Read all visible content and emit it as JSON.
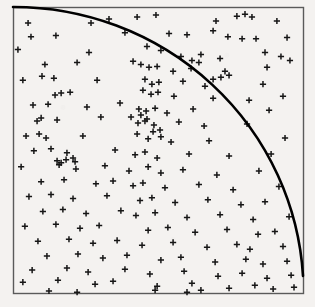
{
  "figure": {
    "kind": "scatter-with-quarter-circle-overlay",
    "background_color": "#f4f2f0",
    "frame": {
      "left": 13,
      "top": 7,
      "right": 303,
      "bottom": 293,
      "stroke_color": "#5a5a5a",
      "stroke_width": 1.4
    }
  },
  "chart_data": {
    "type": "scatter",
    "title": "",
    "xlabel": "",
    "ylabel": "",
    "xlim": [
      0,
      1
    ],
    "ylim": [
      0,
      1
    ],
    "grid": false,
    "legend": "none",
    "marker": {
      "symbol": "plus",
      "size_px": 6.2,
      "stroke_color": "#161616",
      "stroke_width": 1.5
    },
    "annotation": {
      "name": "quarter-circle-arc",
      "description": "Quarter circle of radius 1 centered at the lower-left corner of the unit square, drawn from the top-left corner to the right edge.",
      "center": [
        0,
        0
      ],
      "radius": 1.0,
      "stroke_color": "#000000",
      "stroke_width": 2.6,
      "start_point": [
        0,
        1
      ],
      "end_point": [
        1,
        0.06
      ]
    },
    "n_points": 200,
    "points": [
      [
        0.052,
        0.944
      ],
      [
        0.269,
        0.944
      ],
      [
        0.331,
        0.958
      ],
      [
        0.428,
        0.965
      ],
      [
        0.493,
        0.972
      ],
      [
        0.7,
        0.951
      ],
      [
        0.772,
        0.968
      ],
      [
        0.8,
        0.975
      ],
      [
        0.824,
        0.965
      ],
      [
        0.91,
        0.951
      ],
      [
        0.062,
        0.896
      ],
      [
        0.148,
        0.9
      ],
      [
        0.386,
        0.91
      ],
      [
        0.538,
        0.907
      ],
      [
        0.6,
        0.903
      ],
      [
        0.69,
        0.917
      ],
      [
        0.741,
        0.896
      ],
      [
        0.79,
        0.889
      ],
      [
        0.838,
        0.889
      ],
      [
        0.945,
        0.893
      ],
      [
        0.017,
        0.851
      ],
      [
        0.262,
        0.841
      ],
      [
        0.462,
        0.862
      ],
      [
        0.51,
        0.848
      ],
      [
        0.579,
        0.827
      ],
      [
        0.648,
        0.834
      ],
      [
        0.714,
        0.82
      ],
      [
        0.869,
        0.841
      ],
      [
        0.924,
        0.827
      ],
      [
        0.955,
        0.813
      ],
      [
        0.11,
        0.799
      ],
      [
        0.221,
        0.806
      ],
      [
        0.414,
        0.81
      ],
      [
        0.441,
        0.799
      ],
      [
        0.469,
        0.789
      ],
      [
        0.497,
        0.792
      ],
      [
        0.552,
        0.775
      ],
      [
        0.614,
        0.785
      ],
      [
        0.731,
        0.775
      ],
      [
        0.876,
        0.789
      ],
      [
        0.034,
        0.744
      ],
      [
        0.1,
        0.758
      ],
      [
        0.141,
        0.751
      ],
      [
        0.29,
        0.744
      ],
      [
        0.455,
        0.747
      ],
      [
        0.479,
        0.73
      ],
      [
        0.503,
        0.737
      ],
      [
        0.586,
        0.74
      ],
      [
        0.662,
        0.723
      ],
      [
        0.862,
        0.73
      ],
      [
        0.145,
        0.692
      ],
      [
        0.166,
        0.699
      ],
      [
        0.197,
        0.702
      ],
      [
        0.448,
        0.709
      ],
      [
        0.476,
        0.695
      ],
      [
        0.5,
        0.702
      ],
      [
        0.555,
        0.688
      ],
      [
        0.69,
        0.681
      ],
      [
        0.814,
        0.674
      ],
      [
        0.931,
        0.688
      ],
      [
        0.069,
        0.657
      ],
      [
        0.121,
        0.66
      ],
      [
        0.255,
        0.65
      ],
      [
        0.369,
        0.664
      ],
      [
        0.434,
        0.643
      ],
      [
        0.459,
        0.636
      ],
      [
        0.49,
        0.646
      ],
      [
        0.531,
        0.629
      ],
      [
        0.621,
        0.643
      ],
      [
        0.883,
        0.639
      ],
      [
        0.083,
        0.601
      ],
      [
        0.097,
        0.612
      ],
      [
        0.152,
        0.605
      ],
      [
        0.303,
        0.615
      ],
      [
        0.431,
        0.594
      ],
      [
        0.455,
        0.601
      ],
      [
        0.486,
        0.587
      ],
      [
        0.572,
        0.598
      ],
      [
        0.659,
        0.584
      ],
      [
        0.807,
        0.591
      ],
      [
        0.045,
        0.549
      ],
      [
        0.09,
        0.556
      ],
      [
        0.114,
        0.542
      ],
      [
        0.241,
        0.549
      ],
      [
        0.428,
        0.556
      ],
      [
        0.466,
        0.539
      ],
      [
        0.51,
        0.546
      ],
      [
        0.545,
        0.528
      ],
      [
        0.676,
        0.532
      ],
      [
        0.938,
        0.542
      ],
      [
        0.072,
        0.497
      ],
      [
        0.131,
        0.504
      ],
      [
        0.186,
        0.49
      ],
      [
        0.352,
        0.5
      ],
      [
        0.421,
        0.483
      ],
      [
        0.455,
        0.493
      ],
      [
        0.497,
        0.472
      ],
      [
        0.607,
        0.486
      ],
      [
        0.745,
        0.479
      ],
      [
        0.89,
        0.486
      ],
      [
        0.028,
        0.441
      ],
      [
        0.159,
        0.448
      ],
      [
        0.217,
        0.434
      ],
      [
        0.317,
        0.445
      ],
      [
        0.4,
        0.427
      ],
      [
        0.466,
        0.441
      ],
      [
        0.51,
        0.42
      ],
      [
        0.586,
        0.431
      ],
      [
        0.703,
        0.413
      ],
      [
        0.848,
        0.427
      ],
      [
        0.097,
        0.389
      ],
      [
        0.176,
        0.396
      ],
      [
        0.286,
        0.382
      ],
      [
        0.345,
        0.392
      ],
      [
        0.414,
        0.375
      ],
      [
        0.448,
        0.385
      ],
      [
        0.524,
        0.368
      ],
      [
        0.641,
        0.379
      ],
      [
        0.759,
        0.361
      ],
      [
        0.917,
        0.372
      ],
      [
        0.055,
        0.337
      ],
      [
        0.131,
        0.344
      ],
      [
        0.207,
        0.33
      ],
      [
        0.324,
        0.34
      ],
      [
        0.438,
        0.323
      ],
      [
        0.479,
        0.333
      ],
      [
        0.559,
        0.316
      ],
      [
        0.672,
        0.326
      ],
      [
        0.786,
        0.309
      ],
      [
        0.869,
        0.319
      ],
      [
        0.103,
        0.285
      ],
      [
        0.172,
        0.292
      ],
      [
        0.252,
        0.278
      ],
      [
        0.372,
        0.288
      ],
      [
        0.424,
        0.271
      ],
      [
        0.49,
        0.281
      ],
      [
        0.6,
        0.264
      ],
      [
        0.714,
        0.274
      ],
      [
        0.828,
        0.257
      ],
      [
        0.952,
        0.267
      ],
      [
        0.041,
        0.233
      ],
      [
        0.148,
        0.24
      ],
      [
        0.231,
        0.226
      ],
      [
        0.297,
        0.236
      ],
      [
        0.466,
        0.219
      ],
      [
        0.534,
        0.229
      ],
      [
        0.628,
        0.212
      ],
      [
        0.738,
        0.222
      ],
      [
        0.845,
        0.205
      ],
      [
        0.903,
        0.215
      ],
      [
        0.086,
        0.181
      ],
      [
        0.193,
        0.188
      ],
      [
        0.276,
        0.174
      ],
      [
        0.359,
        0.184
      ],
      [
        0.445,
        0.167
      ],
      [
        0.552,
        0.177
      ],
      [
        0.669,
        0.16
      ],
      [
        0.772,
        0.17
      ],
      [
        0.817,
        0.153
      ],
      [
        0.931,
        0.163
      ],
      [
        0.117,
        0.129
      ],
      [
        0.224,
        0.136
      ],
      [
        0.31,
        0.122
      ],
      [
        0.393,
        0.132
      ],
      [
        0.51,
        0.115
      ],
      [
        0.579,
        0.125
      ],
      [
        0.697,
        0.108
      ],
      [
        0.803,
        0.118
      ],
      [
        0.862,
        0.101
      ],
      [
        0.945,
        0.111
      ],
      [
        0.066,
        0.08
      ],
      [
        0.186,
        0.087
      ],
      [
        0.259,
        0.073
      ],
      [
        0.386,
        0.083
      ],
      [
        0.472,
        0.066
      ],
      [
        0.59,
        0.076
      ],
      [
        0.707,
        0.059
      ],
      [
        0.79,
        0.069
      ],
      [
        0.876,
        0.052
      ],
      [
        0.959,
        0.062
      ],
      [
        0.034,
        0.038
      ],
      [
        0.155,
        0.045
      ],
      [
        0.283,
        0.031
      ],
      [
        0.345,
        0.041
      ],
      [
        0.497,
        0.024
      ],
      [
        0.617,
        0.034
      ],
      [
        0.745,
        0.017
      ],
      [
        0.834,
        0.027
      ],
      [
        0.897,
        0.014
      ],
      [
        0.969,
        0.02
      ],
      [
        0.49,
        0.01
      ],
      [
        0.6,
        0.003
      ],
      [
        0.124,
        0.007
      ],
      [
        0.221,
        0.003
      ],
      [
        0.648,
        0.01
      ],
      [
        0.407,
        0.615
      ],
      [
        0.441,
        0.622
      ],
      [
        0.462,
        0.608
      ],
      [
        0.483,
        0.564
      ],
      [
        0.507,
        0.57
      ],
      [
        0.69,
        0.747
      ],
      [
        0.717,
        0.754
      ],
      [
        0.745,
        0.761
      ],
      [
        0.641,
        0.806
      ],
      [
        0.617,
        0.813
      ],
      [
        0.207,
        0.472
      ],
      [
        0.214,
        0.459
      ],
      [
        0.183,
        0.466
      ],
      [
        0.166,
        0.455
      ],
      [
        0.152,
        0.462
      ]
    ]
  }
}
